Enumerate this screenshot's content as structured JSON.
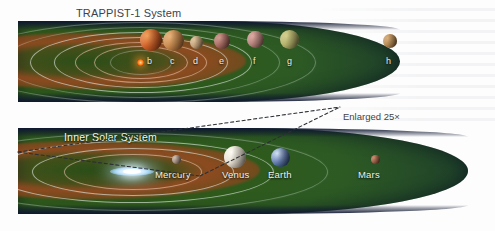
{
  "figure": {
    "kind": "astronomy-comparison-diagram",
    "panels": [
      {
        "id": "trappist",
        "title": "TRAPPIST-1 System",
        "title_color": "#3d4349",
        "star_name": "TRAPPIST-1",
        "star_color": "#ff8a1e",
        "planets": [
          {
            "label": "b",
            "color": "#d2622a",
            "size": 22
          },
          {
            "label": "c",
            "color": "#c98a4e",
            "size": 21
          },
          {
            "label": "d",
            "color": "#c4a27a",
            "size": 13
          },
          {
            "label": "e",
            "color": "#a96a62",
            "size": 16
          },
          {
            "label": "f",
            "color": "#b7837c",
            "size": 17
          },
          {
            "label": "g",
            "color": "#b3b06a",
            "size": 19
          },
          {
            "label": "h",
            "color": "#b58a55",
            "size": 14
          }
        ]
      },
      {
        "id": "solar",
        "title": "Inner Solar System",
        "title_color": "#f2f6f1",
        "star_name": "Sun",
        "star_color": "#ffffff",
        "planets": [
          {
            "label": "Mercury",
            "color": "#a89184",
            "size": 9
          },
          {
            "label": "Venus",
            "color": "#e6ded0",
            "size": 22
          },
          {
            "label": "Earth",
            "color": "#6f86b8",
            "size": 19
          },
          {
            "label": "Mars",
            "color": "#9c5f46",
            "size": 9
          }
        ]
      }
    ],
    "annotation": {
      "enlarged_label": "Enlarged 25×",
      "color": "#3d4349"
    },
    "palette": {
      "disk_green": "#2f5a1c",
      "disk_rim_navy": "#0e1730",
      "habitable_zone": "#a34821",
      "orbit_ring": "#e2ece4",
      "page_background": "#ffffff"
    }
  }
}
